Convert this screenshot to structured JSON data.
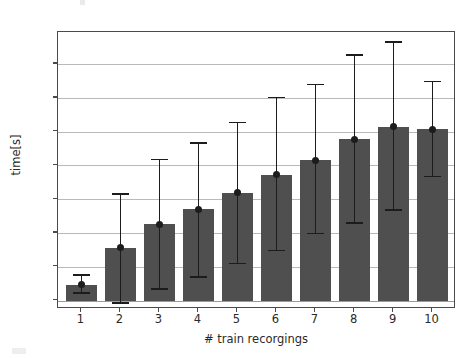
{
  "chart_data": {
    "type": "bar",
    "title": "",
    "xlabel": "# train recorgings",
    "ylabel": "time[s]",
    "categories": [
      "1",
      "2",
      "3",
      "4",
      "5",
      "6",
      "7",
      "8",
      "9",
      "10"
    ],
    "values": [
      47,
      156,
      226,
      270,
      319,
      373,
      416,
      477,
      515,
      507
    ],
    "error_upper": [
      75,
      315,
      417,
      467,
      527,
      601,
      640,
      727,
      765,
      648
    ],
    "error_lower": [
      22,
      -8,
      35,
      70,
      110,
      148,
      199,
      229,
      268,
      367
    ],
    "series": [
      {
        "name": "time[s]",
        "values": [
          47,
          156,
          226,
          270,
          319,
          373,
          416,
          477,
          515,
          507
        ]
      }
    ],
    "ylim": [
      -25,
      795
    ],
    "xlim": [
      0.4,
      10.6
    ],
    "ytick_labels": [
      "0",
      "100",
      "200",
      "300",
      "400",
      "500",
      "600",
      "700"
    ],
    "ytick_values": [
      0,
      100,
      200,
      300,
      400,
      500,
      600,
      700
    ],
    "xtick_labels": [
      "1",
      "2",
      "3",
      "4",
      "5",
      "6",
      "7",
      "8",
      "9",
      "10"
    ],
    "grid": "horizontal",
    "legend": "none",
    "bar_color": "#4f4f4f",
    "errorbar_color": "#1c1c1c",
    "grid_color": "#b9b9b9",
    "marker": "circle"
  }
}
